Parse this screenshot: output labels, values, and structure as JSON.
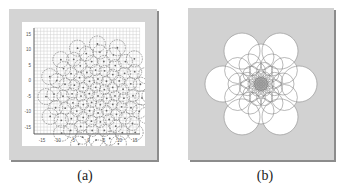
{
  "figure": {
    "panels": [
      {
        "id": "a",
        "caption": "(a)",
        "description": "Grid plot with concentric rings of dashed circles with center dots",
        "x_ticks": [
          "-15",
          "-10",
          "-5",
          "0",
          "5",
          "10",
          "15"
        ],
        "y_ticks": [
          "15",
          "10",
          "5",
          "0",
          "-5",
          "-10",
          "-15"
        ]
      },
      {
        "id": "b",
        "caption": "(b)",
        "description": "Flower-like arrangement of overlapping white circles on gray background"
      }
    ]
  },
  "colors": {
    "frame": "#d4d4d4",
    "shadow": "#8c8c8c",
    "grid": "#cfcfcf",
    "circle_stroke": "#7a7a7a",
    "dot": "#666666"
  },
  "panel_a": {
    "center": [
      76,
      74
    ],
    "scale": 2.6,
    "rings": [
      {
        "n": 1,
        "r": 0,
        "cr": 6
      },
      {
        "n": 6,
        "r": 9,
        "cr": 5
      },
      {
        "n": 12,
        "r": 17,
        "cr": 5
      },
      {
        "n": 18,
        "r": 26,
        "cr": 5.5
      },
      {
        "n": 18,
        "r": 35,
        "cr": 6
      },
      {
        "n": 20,
        "r": 44,
        "cr": 7
      },
      {
        "n": 16,
        "r": 52,
        "cr": 8
      }
    ]
  },
  "panel_b": {
    "center": [
      73,
      76
    ],
    "rings": [
      {
        "n": 6,
        "r": 38,
        "cr": 18,
        "offset": 30
      },
      {
        "n": 6,
        "r": 27,
        "cr": 13,
        "offset": 0
      },
      {
        "n": 6,
        "r": 22,
        "cr": 11,
        "offset": 30
      },
      {
        "n": 12,
        "r": 14,
        "cr": 8,
        "offset": 15
      },
      {
        "n": 12,
        "r": 8,
        "cr": 5,
        "offset": 0
      },
      {
        "n": 12,
        "r": 4,
        "cr": 3,
        "offset": 15
      }
    ]
  }
}
